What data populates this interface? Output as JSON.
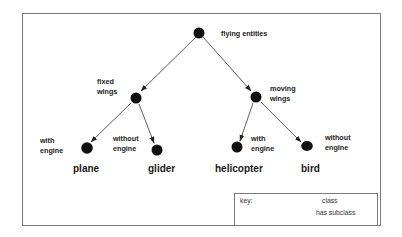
{
  "diagram": {
    "type": "class hierarchy tree",
    "root": {
      "id": "flying-entities",
      "label": "flying entities",
      "children": [
        "fixed-wings",
        "moving-wings"
      ]
    },
    "nodes": {
      "flying_entities": {
        "label": "flying entities"
      },
      "fixed_wings": {
        "line1": "fixed",
        "line2": "wings"
      },
      "moving_wings": {
        "line1": "moving",
        "line2": "wings"
      },
      "plane": {
        "line1": "with",
        "line2": "engine",
        "name": "plane"
      },
      "glider": {
        "line1": "without",
        "line2": "engine",
        "name": "glider"
      },
      "helicopter": {
        "line1": "with",
        "line2": "engine",
        "name": "helicopter"
      },
      "bird": {
        "line1": "without",
        "line2": "engine",
        "name": "bird"
      }
    },
    "edges": [
      {
        "from": "flying entities",
        "to": "fixed wings"
      },
      {
        "from": "flying entities",
        "to": "moving wings"
      },
      {
        "from": "fixed wings",
        "to": "plane"
      },
      {
        "from": "fixed wings",
        "to": "glider"
      },
      {
        "from": "moving wings",
        "to": "helicopter"
      },
      {
        "from": "moving wings",
        "to": "bird"
      }
    ],
    "key": {
      "title": "key:",
      "class_label": "class",
      "subclass_label": "has subclass"
    },
    "colors": {
      "node": "#111111",
      "edge": "#333333",
      "border": "#7a7a7a",
      "background": "#ffffff"
    }
  }
}
